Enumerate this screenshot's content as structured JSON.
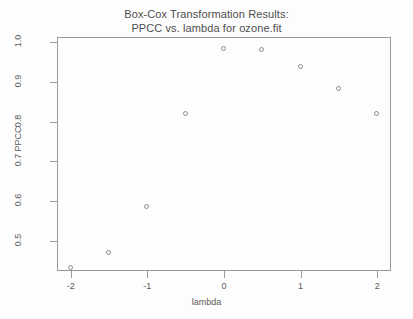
{
  "chart_data": {
    "type": "scatter",
    "title": "Box-Cox Transformation Results: PPCC vs. lambda for ozone.fit",
    "title_lines": [
      "Box-Cox Transformation Results:",
      "PPCC vs. lambda for ozone.fit"
    ],
    "xlabel": "lambda",
    "ylabel": "PPCC",
    "xlim": [
      -2.18,
      2.18
    ],
    "ylim": [
      0.425,
      1.012
    ],
    "xticks": [
      -2,
      -1,
      0,
      1,
      2
    ],
    "xtick_labels": [
      "-2",
      "-1",
      "0",
      "1",
      "2"
    ],
    "yticks": [
      0.5,
      0.6,
      0.7,
      0.8,
      0.9,
      1.0
    ],
    "ytick_labels": [
      "0.5",
      "0.6",
      "0.7",
      "0.8",
      "0.9",
      "1.0"
    ],
    "grid": false,
    "legend": null,
    "marker": "open-circle",
    "marker_color": "#8c8c8c",
    "frame_color": "#9a9a9a",
    "background": "#fdfdfd",
    "x": [
      -2,
      -1.5,
      -1,
      -0.5,
      0,
      0.5,
      1,
      1.5,
      2
    ],
    "y": [
      0.432,
      0.47,
      0.585,
      0.82,
      0.983,
      0.98,
      0.938,
      0.882,
      0.82
    ],
    "series": [
      {
        "name": "PPCC",
        "points": [
          {
            "x": -2,
            "y": 0.432
          },
          {
            "x": -1.5,
            "y": 0.47
          },
          {
            "x": -1,
            "y": 0.585
          },
          {
            "x": -0.5,
            "y": 0.82
          },
          {
            "x": 0,
            "y": 0.983
          },
          {
            "x": 0.5,
            "y": 0.98
          },
          {
            "x": 1,
            "y": 0.938
          },
          {
            "x": 1.5,
            "y": 0.882
          },
          {
            "x": 2,
            "y": 0.82
          }
        ]
      }
    ]
  }
}
